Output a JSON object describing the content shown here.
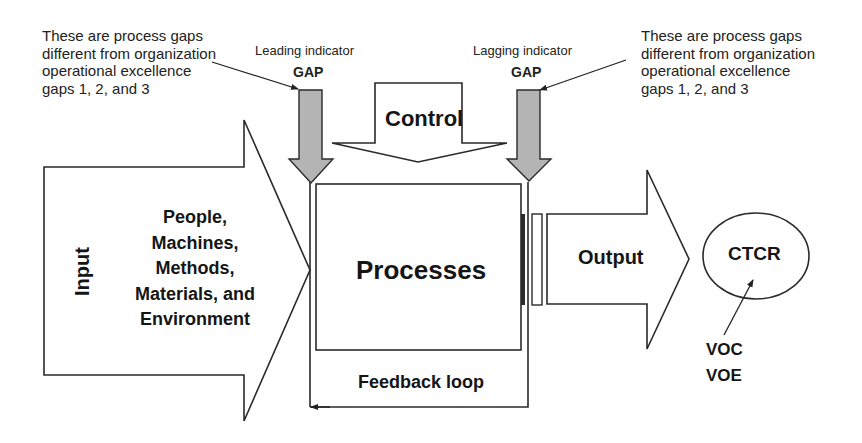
{
  "diagram": {
    "annotations": {
      "left_note": "These are process gaps\ndifferent from organization\noperational excellence\ngaps 1, 2, and 3",
      "right_note": "These are process gaps\ndifferent from organization\noperational excellence\ngaps 1, 2, and 3"
    },
    "gaps": {
      "leading": {
        "indicator": "Leading indicator",
        "label": "GAP"
      },
      "lagging": {
        "indicator": "Lagging indicator",
        "label": "GAP"
      }
    },
    "control": {
      "label": "Control"
    },
    "input": {
      "label": "Input",
      "items": [
        "People,",
        "Machines,",
        "Methods,",
        "Materials, and",
        "Environment"
      ]
    },
    "processes": {
      "label": "Processes"
    },
    "output": {
      "label": "Output"
    },
    "feedback": {
      "label": "Feedback loop"
    },
    "ctcr": {
      "label": "CTCR"
    },
    "voice": {
      "voc": "VOC",
      "voe": "VOE"
    },
    "colors": {
      "gap_arrow_fill": "#b4b4b4",
      "line": "#2a2a2a",
      "background": "#ffffff"
    }
  }
}
